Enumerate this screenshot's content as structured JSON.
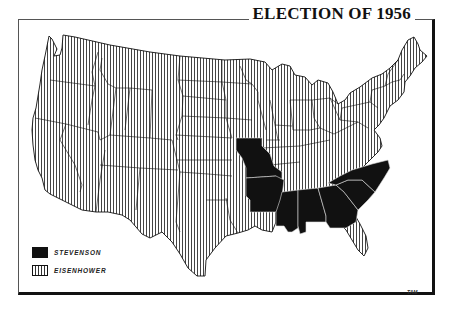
{
  "title": "ELECTION OF 1956",
  "legend": {
    "items": [
      {
        "label": "STEVENSON",
        "pattern": "solid-black",
        "color": "#111111"
      },
      {
        "label": "EISENHOWER",
        "pattern": "vertical-stripes",
        "color": "#333333"
      }
    ]
  },
  "signature": "TAM",
  "map": {
    "stevenson_states": [
      "Missouri",
      "Arkansas",
      "Mississippi",
      "Alabama",
      "Georgia",
      "South Carolina",
      "North Carolina"
    ],
    "eisenhower_states": "all other states"
  }
}
